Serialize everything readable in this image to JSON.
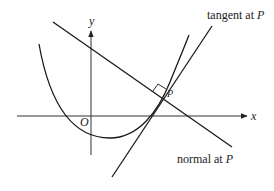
{
  "diagram": {
    "axes": {
      "x_label": "x",
      "y_label": "y",
      "origin_label": "O"
    },
    "point": {
      "label": "P"
    },
    "labels": {
      "tangent_text": "tangent at ",
      "tangent_point": "P",
      "normal_text": "normal at ",
      "normal_point": "P"
    },
    "colors": {
      "line": "#1a1a1a",
      "axis": "#333333",
      "background": "#ffffff"
    }
  }
}
